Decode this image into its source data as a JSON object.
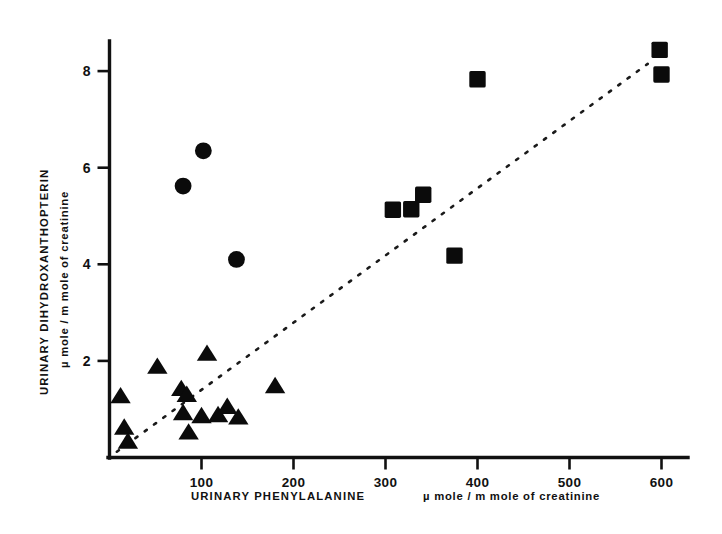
{
  "chart_data": {
    "type": "scatter",
    "title": "",
    "xlabel": "URINARY  PHENYLALANINE",
    "xlabel_units": "µ mole /  m  mole  of   creatinine",
    "ylabel_line1": "URINARY   DIHYDROXANTHOPTERIN",
    "ylabel_line2": "µ mole  /  m mole  of  creatinine",
    "xlim": [
      0,
      655
    ],
    "ylim": [
      0,
      8.95
    ],
    "xticks": [
      100,
      200,
      300,
      400,
      500,
      600
    ],
    "xtick_labels": [
      "100",
      "200",
      "300",
      "400",
      "500",
      "600"
    ],
    "yticks": [
      2,
      4,
      6,
      8
    ],
    "ytick_labels": [
      "2",
      "4",
      "6",
      "8"
    ],
    "grid": false,
    "legend_position": "none",
    "marker_color": "#0b0b0b",
    "axis_color": "#111111",
    "trendline": {
      "style": "dotted",
      "x_start": 8,
      "y_start": 0.12,
      "x_end": 585,
      "y_end": 8.15
    },
    "series": [
      {
        "name": "circles",
        "marker": "circle",
        "points": [
          {
            "x": 80,
            "y": 5.62
          },
          {
            "x": 102,
            "y": 6.35
          },
          {
            "x": 138,
            "y": 4.1
          }
        ]
      },
      {
        "name": "squares",
        "marker": "square",
        "points": [
          {
            "x": 308,
            "y": 5.13
          },
          {
            "x": 328,
            "y": 5.14
          },
          {
            "x": 341,
            "y": 5.44
          },
          {
            "x": 375,
            "y": 4.18
          },
          {
            "x": 400,
            "y": 7.83
          },
          {
            "x": 598,
            "y": 8.44
          },
          {
            "x": 600,
            "y": 7.93
          }
        ]
      },
      {
        "name": "triangles",
        "marker": "triangle",
        "points": [
          {
            "x": 12,
            "y": 1.27
          },
          {
            "x": 16,
            "y": 0.62
          },
          {
            "x": 20,
            "y": 0.33
          },
          {
            "x": 52,
            "y": 1.88
          },
          {
            "x": 78,
            "y": 1.42
          },
          {
            "x": 84,
            "y": 1.3
          },
          {
            "x": 80,
            "y": 0.92
          },
          {
            "x": 86,
            "y": 0.52
          },
          {
            "x": 100,
            "y": 0.86
          },
          {
            "x": 106,
            "y": 2.15
          },
          {
            "x": 118,
            "y": 0.88
          },
          {
            "x": 128,
            "y": 1.05
          },
          {
            "x": 140,
            "y": 0.83
          },
          {
            "x": 180,
            "y": 1.48
          }
        ]
      }
    ]
  }
}
